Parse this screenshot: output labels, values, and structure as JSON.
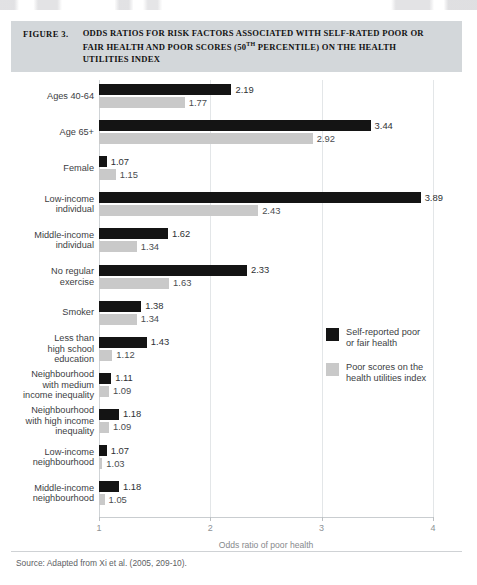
{
  "figure": {
    "number": "FIGURE 3.",
    "title_line1": "ODDS RATIOS FOR RISK FACTORS ASSOCIATED WITH SELF-RATED POOR",
    "title_line2_a": "OR FAIR HEALTH AND POOR SCORES (50",
    "title_line2_sup": "TH",
    "title_line2_b": " PERCENTILE) ON THE HEALTH",
    "title_line3": "UTILITIES INDEX"
  },
  "source": "Source: Adapted from Xi et al. (2005, 209-10).",
  "colors": {
    "series_dark": "#141414",
    "series_light": "#c9c9c9",
    "title_band": "#d3d7da"
  },
  "chart_data": {
    "type": "bar",
    "orientation": "horizontal",
    "title": "ODDS RATIOS FOR RISK FACTORS ASSOCIATED WITH SELF-RATED POOR OR FAIR HEALTH AND POOR SCORES (50TH PERCENTILE) ON THE HEALTH UTILITIES INDEX",
    "xlabel": "Odds ratio of poor health",
    "ylabel": "",
    "xlim": [
      1,
      4
    ],
    "xticks": [
      "1",
      "2",
      "3",
      "4"
    ],
    "grid": true,
    "legend_position": "right-middle",
    "categories": [
      "Ages 40-64",
      "Age 65+",
      "Female",
      "Low-income individual",
      "Middle-income individual",
      "No regular exercise",
      "Smoker",
      "Less than high school education",
      "Neighbourhood with medium income inequality",
      "Neighbourhood with high income inequality",
      "Low-income neighbourhood",
      "Middle-income neighbourhood"
    ],
    "series": [
      {
        "name": "Self-reported poor or fair health",
        "color": "#141414",
        "values": [
          2.19,
          3.44,
          1.07,
          3.89,
          1.62,
          2.33,
          1.38,
          1.43,
          1.11,
          1.18,
          1.07,
          1.18
        ]
      },
      {
        "name": "Poor scores on the health utilities index",
        "color": "#c9c9c9",
        "values": [
          1.77,
          2.92,
          1.15,
          2.43,
          1.34,
          1.63,
          1.34,
          1.12,
          1.09,
          1.09,
          1.03,
          1.05
        ]
      }
    ]
  },
  "groups": [
    {
      "label_lines": [
        "Ages 40-64"
      ],
      "dark": "2.19",
      "light": "1.77"
    },
    {
      "label_lines": [
        "Age 65+"
      ],
      "dark": "3.44",
      "light": "2.92"
    },
    {
      "label_lines": [
        "Female"
      ],
      "dark": "1.07",
      "light": "1.15"
    },
    {
      "label_lines": [
        "Low-income",
        "individual"
      ],
      "dark": "3.89",
      "light": "2.43"
    },
    {
      "label_lines": [
        "Middle-income",
        "individual"
      ],
      "dark": "1.62",
      "light": "1.34"
    },
    {
      "label_lines": [
        "No regular",
        "exercise"
      ],
      "dark": "2.33",
      "light": "1.63"
    },
    {
      "label_lines": [
        "Smoker"
      ],
      "dark": "1.38",
      "light": "1.34"
    },
    {
      "label_lines": [
        "Less than",
        "high school",
        "education"
      ],
      "dark": "1.43",
      "light": "1.12"
    },
    {
      "label_lines": [
        "Neighbourhood",
        "with medium",
        "income inequality"
      ],
      "dark": "1.11",
      "light": "1.09"
    },
    {
      "label_lines": [
        "Neighbourhood",
        "with high income",
        "inequality"
      ],
      "dark": "1.18",
      "light": "1.09"
    },
    {
      "label_lines": [
        "Low-income",
        "neighbourhood"
      ],
      "dark": "1.07",
      "light": "1.03"
    },
    {
      "label_lines": [
        "Middle-income",
        "neighbourhood"
      ],
      "dark": "1.18",
      "light": "1.05"
    }
  ],
  "legend": [
    {
      "swatch": "dark",
      "lines": [
        "Self-reported poor",
        "or fair health"
      ]
    },
    {
      "swatch": "light",
      "lines": [
        "Poor scores on the",
        "health utilities index"
      ]
    }
  ]
}
